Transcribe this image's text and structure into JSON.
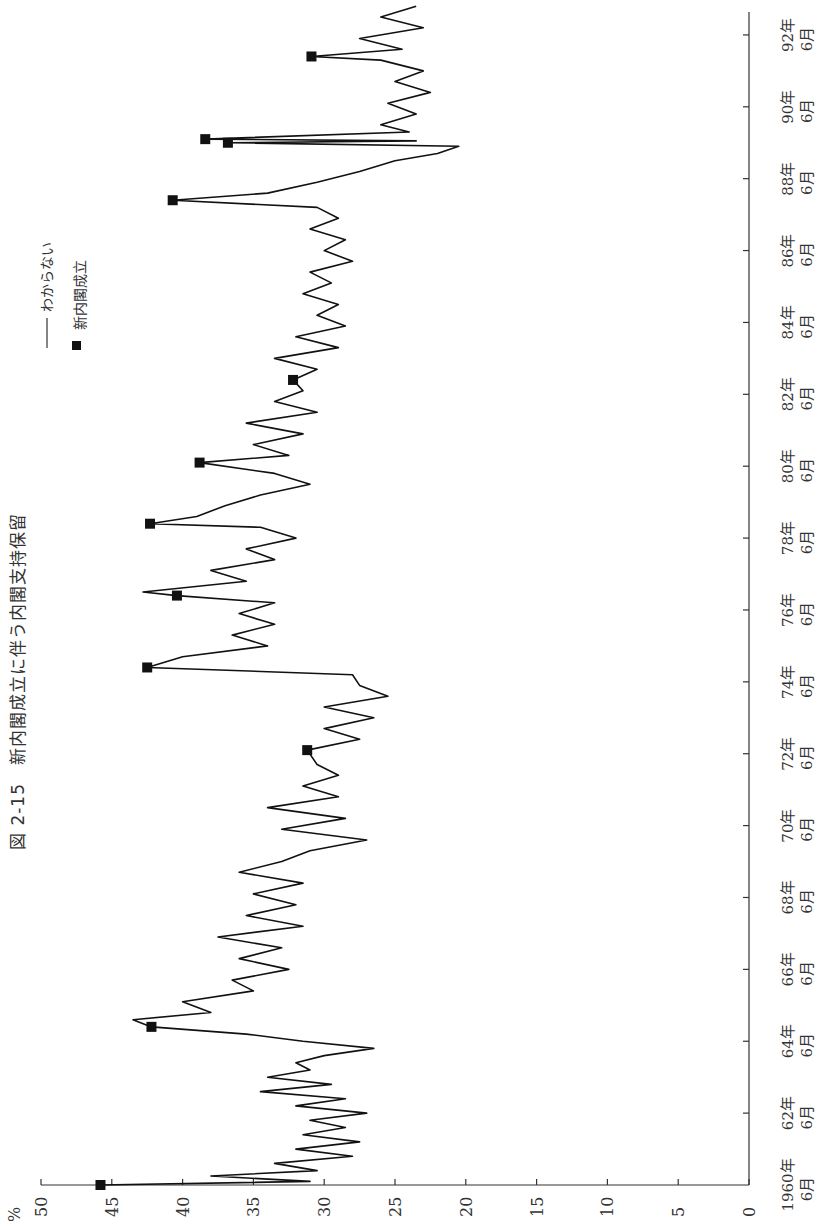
{
  "title": "図 2-15　新内閣成立に伴う内閣支持保留",
  "legend": {
    "line_label": "わからない",
    "marker_label": "新内閣成立"
  },
  "value_axis": {
    "unit": "%",
    "ticks": [
      "50",
      "45",
      "40",
      "35",
      "30",
      "25",
      "20",
      "15",
      "10",
      "5",
      "0"
    ]
  },
  "time_axis": {
    "ticks": [
      {
        "year": "1960年",
        "month": "6月"
      },
      {
        "year": "62年",
        "month": "6月"
      },
      {
        "year": "64年",
        "month": "6月"
      },
      {
        "year": "66年",
        "month": "6月"
      },
      {
        "year": "68年",
        "month": "6月"
      },
      {
        "year": "70年",
        "month": "6月"
      },
      {
        "year": "72年",
        "month": "6月"
      },
      {
        "year": "74年",
        "month": "6月"
      },
      {
        "year": "76年",
        "month": "6月"
      },
      {
        "year": "78年",
        "month": "6月"
      },
      {
        "year": "80年",
        "month": "6月"
      },
      {
        "year": "82年",
        "month": "6月"
      },
      {
        "year": "84年",
        "month": "6月"
      },
      {
        "year": "86年",
        "month": "6月"
      },
      {
        "year": "88年",
        "month": "6月"
      },
      {
        "year": "90年",
        "month": "6月"
      },
      {
        "year": "92年",
        "month": "6月"
      }
    ]
  },
  "chart_data": {
    "type": "line",
    "orientation": "rotated 90° counter-clockwise (time runs bottom→top along right edge, percentage runs right→left along bottom)",
    "xlabel": "",
    "ylabel": "%",
    "ylim": [
      0,
      50
    ],
    "xlim": [
      1960.5,
      1993.3
    ],
    "grid": false,
    "legend_position": "upper-left (rotated)",
    "series": [
      {
        "name": "わからない",
        "style": "line",
        "x": [
          1960.5,
          1960.6,
          1960.75,
          1960.9,
          1961.1,
          1961.3,
          1961.5,
          1961.7,
          1961.9,
          1962.1,
          1962.3,
          1962.5,
          1962.7,
          1962.9,
          1963.1,
          1963.3,
          1963.5,
          1963.7,
          1963.9,
          1964.1,
          1964.3,
          1964.5,
          1964.7,
          1964.9,
          1965.1,
          1965.3,
          1965.6,
          1965.9,
          1966.2,
          1966.5,
          1966.8,
          1967.1,
          1967.4,
          1967.7,
          1968.0,
          1968.3,
          1968.6,
          1968.9,
          1969.2,
          1969.5,
          1969.8,
          1970.1,
          1970.4,
          1970.7,
          1971.0,
          1971.3,
          1971.6,
          1971.9,
          1972.2,
          1972.6,
          1972.9,
          1973.2,
          1973.5,
          1973.8,
          1974.1,
          1974.4,
          1974.7,
          1974.9,
          1975.2,
          1975.5,
          1975.8,
          1976.1,
          1976.4,
          1976.7,
          1976.9,
          1977.0,
          1977.3,
          1977.6,
          1977.9,
          1978.2,
          1978.5,
          1978.8,
          1978.9,
          1979.1,
          1979.4,
          1979.7,
          1980.0,
          1980.3,
          1980.6,
          1980.8,
          1981.1,
          1981.4,
          1981.7,
          1982.0,
          1982.3,
          1982.6,
          1982.9,
          1983.2,
          1983.5,
          1983.8,
          1984.1,
          1984.4,
          1984.7,
          1985.0,
          1985.3,
          1985.6,
          1985.9,
          1986.2,
          1986.5,
          1986.8,
          1987.1,
          1987.4,
          1987.7,
          1987.9,
          1988.1,
          1988.4,
          1988.7,
          1989.0,
          1989.2,
          1989.4,
          1989.5,
          1989.55,
          1989.6,
          1989.8,
          1990.0,
          1990.3,
          1990.6,
          1990.9,
          1991.2,
          1991.5,
          1991.8,
          1991.9,
          1992.1,
          1992.4,
          1992.7,
          1993.0,
          1993.3
        ],
        "values": [
          45.8,
          31.0,
          38.0,
          30.5,
          33.5,
          28.0,
          32.0,
          27.5,
          31.5,
          28.5,
          31.0,
          27.0,
          32.0,
          28.5,
          34.5,
          29.5,
          34.0,
          31.0,
          32.0,
          30.0,
          26.5,
          31.5,
          35.5,
          42.2,
          43.5,
          38.0,
          40.0,
          35.0,
          36.5,
          32.5,
          36.0,
          33.0,
          37.5,
          31.5,
          35.5,
          32.0,
          35.0,
          31.5,
          36.0,
          33.0,
          31.0,
          27.0,
          33.0,
          28.5,
          34.0,
          29.0,
          31.5,
          29.0,
          30.5,
          31.2,
          27.5,
          30.0,
          26.5,
          30.0,
          25.5,
          27.5,
          28.0,
          42.5,
          40.0,
          34.0,
          36.5,
          33.5,
          36.0,
          33.5,
          40.4,
          42.8,
          35.5,
          38.0,
          33.5,
          35.5,
          32.0,
          34.5,
          42.3,
          39.0,
          37.0,
          34.5,
          31.0,
          33.5,
          38.8,
          32.5,
          35.0,
          31.5,
          35.5,
          30.5,
          33.5,
          31.5,
          32.2,
          30.5,
          33.5,
          29.0,
          32.0,
          28.5,
          30.5,
          29.0,
          31.5,
          29.5,
          31.0,
          28.0,
          30.0,
          28.5,
          31.0,
          29.0,
          30.5,
          40.7,
          34.0,
          30.5,
          27.5,
          25.0,
          22.0,
          20.5,
          36.8,
          23.5,
          38.4,
          24.0,
          26.0,
          23.5,
          25.5,
          22.5,
          25.0,
          23.0,
          26.0,
          30.9,
          24.5,
          27.5,
          23.0,
          26.0,
          23.5
        ]
      },
      {
        "name": "新内閣成立",
        "style": "marker",
        "x": [
          1960.5,
          1964.9,
          1972.6,
          1974.9,
          1976.9,
          1978.9,
          1980.6,
          1982.9,
          1987.9,
          1989.5,
          1989.6,
          1991.9
        ],
        "values": [
          45.8,
          42.2,
          31.2,
          42.5,
          40.4,
          42.3,
          38.8,
          32.2,
          40.7,
          36.8,
          38.4,
          30.9
        ]
      }
    ]
  }
}
